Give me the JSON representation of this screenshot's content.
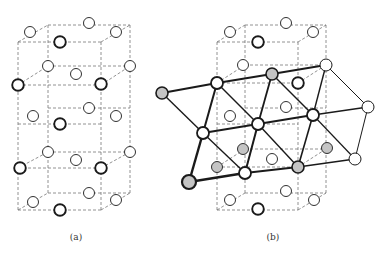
{
  "figure": {
    "panels": [
      {
        "id": "a",
        "label": "(a)",
        "label_pos": [
          76,
          239
        ],
        "dashed_edges": [
          [
            [
              18,
              42
            ],
            [
              101,
              42
            ]
          ],
          [
            [
              48,
              25
            ],
            [
              130,
              25
            ]
          ],
          [
            [
              18,
              42
            ],
            [
              48,
              25
            ]
          ],
          [
            [
              101,
              42
            ],
            [
              130,
              25
            ]
          ],
          [
            [
              18,
              42
            ],
            [
              18,
              210
            ]
          ],
          [
            [
              101,
              42
            ],
            [
              101,
              210
            ]
          ],
          [
            [
              48,
              25
            ],
            [
              48,
              193
            ]
          ],
          [
            [
              130,
              25
            ],
            [
              130,
              193
            ]
          ],
          [
            [
              18,
              85
            ],
            [
              101,
              85
            ]
          ],
          [
            [
              48,
              66
            ],
            [
              130,
              66
            ]
          ],
          [
            [
              18,
              85
            ],
            [
              48,
              66
            ]
          ],
          [
            [
              101,
              85
            ],
            [
              130,
              66
            ]
          ],
          [
            [
              18,
              124
            ],
            [
              101,
              124
            ]
          ],
          [
            [
              48,
              108
            ],
            [
              130,
              108
            ]
          ],
          [
            [
              18,
              168
            ],
            [
              101,
              168
            ]
          ],
          [
            [
              48,
              152
            ],
            [
              130,
              152
            ]
          ],
          [
            [
              18,
              168
            ],
            [
              48,
              152
            ]
          ],
          [
            [
              101,
              168
            ],
            [
              130,
              152
            ]
          ],
          [
            [
              18,
              210
            ],
            [
              101,
              210
            ]
          ],
          [
            [
              48,
              193
            ],
            [
              130,
              193
            ]
          ],
          [
            [
              18,
              210
            ],
            [
              48,
              193
            ]
          ],
          [
            [
              101,
              210
            ],
            [
              130,
              193
            ]
          ]
        ],
        "atoms": [
          {
            "x": 30,
            "y": 32,
            "type": "thin"
          },
          {
            "x": 89,
            "y": 23,
            "type": "thin"
          },
          {
            "x": 116,
            "y": 32,
            "type": "thin"
          },
          {
            "x": 60,
            "y": 42,
            "type": "thick"
          },
          {
            "x": 48,
            "y": 66,
            "type": "thin"
          },
          {
            "x": 76,
            "y": 74,
            "type": "thin"
          },
          {
            "x": 130,
            "y": 66,
            "type": "thin"
          },
          {
            "x": 18,
            "y": 85,
            "type": "thick"
          },
          {
            "x": 101,
            "y": 84,
            "type": "thick"
          },
          {
            "x": 89,
            "y": 108,
            "type": "thin"
          },
          {
            "x": 33,
            "y": 116,
            "type": "thin"
          },
          {
            "x": 116,
            "y": 116,
            "type": "thin"
          },
          {
            "x": 60,
            "y": 124,
            "type": "thick"
          },
          {
            "x": 48,
            "y": 152,
            "type": "thin"
          },
          {
            "x": 76,
            "y": 160,
            "type": "thin"
          },
          {
            "x": 130,
            "y": 152,
            "type": "thin"
          },
          {
            "x": 20,
            "y": 168,
            "type": "thick"
          },
          {
            "x": 101,
            "y": 168,
            "type": "thick"
          },
          {
            "x": 89,
            "y": 193,
            "type": "thin"
          },
          {
            "x": 33,
            "y": 202,
            "type": "thin"
          },
          {
            "x": 116,
            "y": 200,
            "type": "thin"
          },
          {
            "x": 60,
            "y": 210,
            "type": "thick"
          }
        ]
      },
      {
        "id": "b",
        "label": "(b)",
        "label_pos": [
          273,
          239
        ],
        "dashed_edges": [
          [
            [
              217,
              42
            ],
            [
              298,
              42
            ]
          ],
          [
            [
              245,
              25
            ],
            [
              326,
              25
            ]
          ],
          [
            [
              217,
              42
            ],
            [
              245,
              25
            ]
          ],
          [
            [
              298,
              42
            ],
            [
              326,
              25
            ]
          ],
          [
            [
              217,
              42
            ],
            [
              217,
              210
            ]
          ],
          [
            [
              298,
              42
            ],
            [
              298,
              210
            ]
          ],
          [
            [
              245,
              25
            ],
            [
              245,
              193
            ]
          ],
          [
            [
              326,
              25
            ],
            [
              326,
              193
            ]
          ],
          [
            [
              217,
              83
            ],
            [
              298,
              83
            ]
          ],
          [
            [
              245,
              65
            ],
            [
              326,
              65
            ]
          ],
          [
            [
              217,
              83
            ],
            [
              245,
              65
            ]
          ],
          [
            [
              298,
              83
            ],
            [
              326,
              65
            ]
          ],
          [
            [
              217,
              124
            ],
            [
              298,
              124
            ]
          ],
          [
            [
              245,
              108
            ],
            [
              326,
              108
            ]
          ],
          [
            [
              217,
              167
            ],
            [
              298,
              167
            ]
          ],
          [
            [
              245,
              149
            ],
            [
              326,
              149
            ]
          ],
          [
            [
              217,
              167
            ],
            [
              245,
              149
            ]
          ],
          [
            [
              298,
              167
            ],
            [
              326,
              149
            ]
          ],
          [
            [
              217,
              210
            ],
            [
              298,
              210
            ]
          ],
          [
            [
              245,
              193
            ],
            [
              326,
              193
            ]
          ],
          [
            [
              217,
              210
            ],
            [
              245,
              193
            ]
          ],
          [
            [
              298,
              210
            ],
            [
              326,
              193
            ]
          ]
        ],
        "solid_edges": [
          {
            "p": [
              [
                162,
                93
              ],
              [
                217,
                83
              ]
            ],
            "w": 2.2
          },
          {
            "p": [
              [
                217,
                83
              ],
              [
                272,
                74
              ]
            ],
            "w": 2.2
          },
          {
            "p": [
              [
                272,
                74
              ],
              [
                326,
                65
              ]
            ],
            "w": 1.8
          },
          {
            "p": [
              [
                203,
                133
              ],
              [
                258,
                124
              ]
            ],
            "w": 2.2
          },
          {
            "p": [
              [
                258,
                124
              ],
              [
                313,
                115
              ]
            ],
            "w": 2
          },
          {
            "p": [
              [
                313,
                115
              ],
              [
                368,
                107
              ]
            ],
            "w": 1.6
          },
          {
            "p": [
              [
                189,
                182
              ],
              [
                245,
                173
              ]
            ],
            "w": 2.4
          },
          {
            "p": [
              [
                245,
                173
              ],
              [
                298,
                167
              ]
            ],
            "w": 2.2
          },
          {
            "p": [
              [
                298,
                167
              ],
              [
                355,
                159
              ]
            ],
            "w": 1.6
          },
          {
            "p": [
              [
                162,
                93
              ],
              [
                203,
                133
              ]
            ],
            "w": 1.4
          },
          {
            "p": [
              [
                203,
                133
              ],
              [
                189,
                182
              ]
            ],
            "w": 2.4
          },
          {
            "p": [
              [
                217,
                83
              ],
              [
                203,
                133
              ]
            ],
            "w": 2
          },
          {
            "p": [
              [
                217,
                83
              ],
              [
                258,
                124
              ]
            ],
            "w": 1.4
          },
          {
            "p": [
              [
                203,
                133
              ],
              [
                245,
                173
              ]
            ],
            "w": 1.4
          },
          {
            "p": [
              [
                272,
                74
              ],
              [
                258,
                124
              ]
            ],
            "w": 1.8
          },
          {
            "p": [
              [
                272,
                74
              ],
              [
                313,
                115
              ]
            ],
            "w": 1.4
          },
          {
            "p": [
              [
                258,
                124
              ],
              [
                245,
                173
              ]
            ],
            "w": 2
          },
          {
            "p": [
              [
                258,
                124
              ],
              [
                298,
                167
              ]
            ],
            "w": 1.4
          },
          {
            "p": [
              [
                326,
                65
              ],
              [
                313,
                115
              ]
            ],
            "w": 1.4
          },
          {
            "p": [
              [
                326,
                65
              ],
              [
                368,
                107
              ]
            ],
            "w": 1
          },
          {
            "p": [
              [
                313,
                115
              ],
              [
                298,
                167
              ]
            ],
            "w": 1.6
          },
          {
            "p": [
              [
                313,
                115
              ],
              [
                355,
                159
              ]
            ],
            "w": 1.2
          },
          {
            "p": [
              [
                368,
                107
              ],
              [
                355,
                159
              ]
            ],
            "w": 1
          }
        ],
        "atoms": [
          {
            "x": 230,
            "y": 32,
            "type": "thin"
          },
          {
            "x": 286,
            "y": 23,
            "type": "thin"
          },
          {
            "x": 313,
            "y": 32,
            "type": "thin"
          },
          {
            "x": 258,
            "y": 42,
            "type": "thick"
          },
          {
            "x": 243,
            "y": 65,
            "type": "thin"
          },
          {
            "x": 298,
            "y": 83,
            "type": "thick"
          },
          {
            "x": 230,
            "y": 116,
            "type": "thin"
          },
          {
            "x": 286,
            "y": 107,
            "type": "thin"
          },
          {
            "x": 243,
            "y": 149,
            "type": "gray"
          },
          {
            "x": 272,
            "y": 159,
            "type": "thin"
          },
          {
            "x": 327,
            "y": 148,
            "type": "gray"
          },
          {
            "x": 217,
            "y": 167,
            "type": "gray"
          },
          {
            "x": 286,
            "y": 191,
            "type": "thin"
          },
          {
            "x": 230,
            "y": 200,
            "type": "thin"
          },
          {
            "x": 314,
            "y": 200,
            "type": "thin"
          },
          {
            "x": 258,
            "y": 209,
            "type": "thick"
          },
          {
            "x": 162,
            "y": 93,
            "type": "gray-lattice"
          },
          {
            "x": 217,
            "y": 83,
            "type": "lattice"
          },
          {
            "x": 272,
            "y": 74,
            "type": "gray-lattice"
          },
          {
            "x": 326,
            "y": 65,
            "type": "lattice-thin"
          },
          {
            "x": 203,
            "y": 133,
            "type": "lattice"
          },
          {
            "x": 258,
            "y": 124,
            "type": "lattice"
          },
          {
            "x": 313,
            "y": 115,
            "type": "lattice"
          },
          {
            "x": 368,
            "y": 107,
            "type": "lattice-thin"
          },
          {
            "x": 189,
            "y": 182,
            "type": "gray-lattice-big"
          },
          {
            "x": 245,
            "y": 173,
            "type": "lattice"
          },
          {
            "x": 298,
            "y": 167,
            "type": "gray-lattice"
          },
          {
            "x": 355,
            "y": 159,
            "type": "lattice-thin"
          }
        ]
      }
    ],
    "colors": {
      "line": "#1a1a1a",
      "dash": "#777777",
      "gray_fill": "#c4c4c4",
      "white_fill": "#ffffff"
    }
  }
}
